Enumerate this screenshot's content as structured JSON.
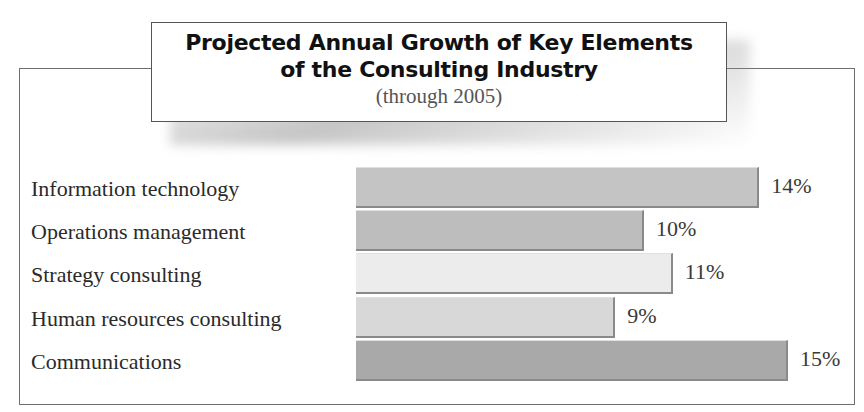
{
  "title_line1": "Projected Annual Growth of Key Elements",
  "title_line2": "of the Consulting Industry",
  "subtitle": "(through 2005)",
  "chart_data": {
    "type": "bar",
    "orientation": "horizontal",
    "title": "Projected Annual Growth of Key Elements of the Consulting Industry",
    "subtitle": "(through 2005)",
    "categories": [
      "Information technology",
      "Operations management",
      "Strategy consulting",
      "Human resources consulting",
      "Communications"
    ],
    "values": [
      14,
      10,
      11,
      9,
      15
    ],
    "value_labels": [
      "14%",
      "10%",
      "11%",
      "9%",
      "15%"
    ],
    "colors": [
      "#c4c4c4",
      "#bdbdbd",
      "#ececec",
      "#d8d8d8",
      "#a9a9a9"
    ],
    "xlabel": "",
    "ylabel": "",
    "grid": false,
    "legend": "none"
  }
}
